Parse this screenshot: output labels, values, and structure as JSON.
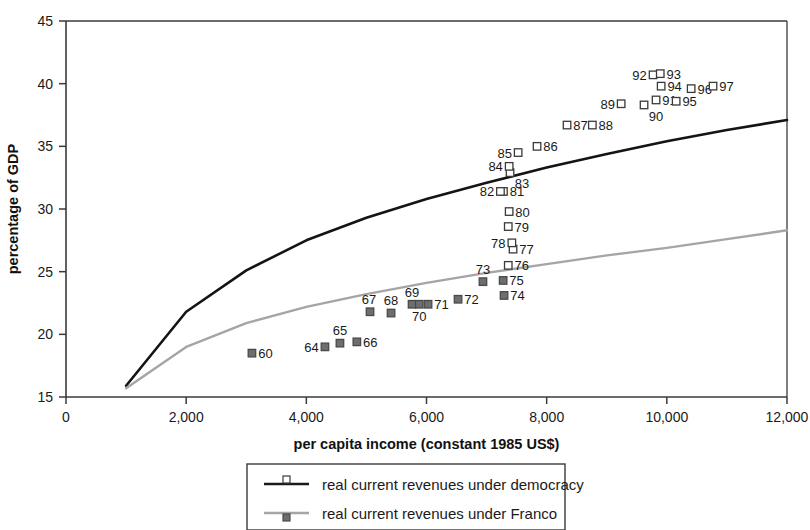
{
  "chart_data": {
    "type": "scatter",
    "title": "",
    "xlabel": "per capita income (constant 1985 US$)",
    "ylabel": "percentage of GDP",
    "xlim": [
      0,
      12000
    ],
    "ylim": [
      15,
      45
    ],
    "xticks": [
      0,
      2000,
      4000,
      6000,
      8000,
      10000,
      12000
    ],
    "xticklabels": [
      "0",
      "2,000",
      "4,000",
      "6,000",
      "8,000",
      "10,000",
      "12,000"
    ],
    "yticks": [
      15,
      20,
      25,
      30,
      35,
      40,
      45
    ],
    "yticklabels": [
      "15",
      "20",
      "25",
      "30",
      "35",
      "40",
      "45"
    ],
    "grid": false,
    "legend_position": "below-center",
    "legend": [
      {
        "label": "real current revenues under democracy",
        "marker": "open-square",
        "line_color": "#1a1a1a"
      },
      {
        "label": "real current revenues under Franco",
        "marker": "filled-square",
        "line_color": "#a5a5a5"
      }
    ],
    "series": [
      {
        "name": "real current revenues under democracy",
        "marker": "open-square",
        "marker_color": "#ffffff",
        "marker_edge": "#3a3a3a",
        "points": [
          {
            "label": "76",
            "x": 7360,
            "y": 25.5,
            "label_pos": "right"
          },
          {
            "label": "77",
            "x": 7440,
            "y": 26.8,
            "label_pos": "right"
          },
          {
            "label": "78",
            "x": 7420,
            "y": 27.3,
            "label_pos": "left"
          },
          {
            "label": "79",
            "x": 7360,
            "y": 28.6,
            "label_pos": "right"
          },
          {
            "label": "80",
            "x": 7375,
            "y": 29.8,
            "label_pos": "right"
          },
          {
            "label": "81",
            "x": 7280,
            "y": 31.4,
            "label_pos": "right"
          },
          {
            "label": "82",
            "x": 7230,
            "y": 31.4,
            "label_pos": "left"
          },
          {
            "label": "83",
            "x": 7390,
            "y": 32.9,
            "label_pos": "below-right"
          },
          {
            "label": "84",
            "x": 7375,
            "y": 33.4,
            "label_pos": "left"
          },
          {
            "label": "85",
            "x": 7525,
            "y": 34.5,
            "label_pos": "left"
          },
          {
            "label": "86",
            "x": 7840,
            "y": 35.0,
            "label_pos": "right"
          },
          {
            "label": "87",
            "x": 8340,
            "y": 36.7,
            "label_pos": "right"
          },
          {
            "label": "88",
            "x": 8760,
            "y": 36.7,
            "label_pos": "right"
          },
          {
            "label": "89",
            "x": 9240,
            "y": 38.4,
            "label_pos": "left"
          },
          {
            "label": "90",
            "x": 9620,
            "y": 38.3,
            "label_pos": "below-right"
          },
          {
            "label": "91",
            "x": 9820,
            "y": 38.7,
            "label_pos": "right"
          },
          {
            "label": "92",
            "x": 9770,
            "y": 40.7,
            "label_pos": "left"
          },
          {
            "label": "93",
            "x": 9890,
            "y": 40.8,
            "label_pos": "right"
          },
          {
            "label": "94",
            "x": 9905,
            "y": 39.8,
            "label_pos": "right"
          },
          {
            "label": "95",
            "x": 10155,
            "y": 38.6,
            "label_pos": "right"
          },
          {
            "label": "96",
            "x": 10405,
            "y": 39.6,
            "label_pos": "right"
          },
          {
            "label": "97",
            "x": 10770,
            "y": 39.8,
            "label_pos": "right"
          }
        ]
      },
      {
        "name": "real current revenues under Franco",
        "marker": "filled-square",
        "marker_color": "#6e6e6e",
        "marker_edge": "#4a4a4a",
        "points": [
          {
            "label": "60",
            "x": 3095,
            "y": 18.5,
            "label_pos": "right"
          },
          {
            "label": "64",
            "x": 4310,
            "y": 19.0,
            "label_pos": "left"
          },
          {
            "label": "65",
            "x": 4560,
            "y": 19.3,
            "label_pos": "above"
          },
          {
            "label": "66",
            "x": 4840,
            "y": 19.4,
            "label_pos": "right"
          },
          {
            "label": "67",
            "x": 5060,
            "y": 21.8,
            "label_pos": "above-left"
          },
          {
            "label": "68",
            "x": 5410,
            "y": 21.7,
            "label_pos": "above"
          },
          {
            "label": "69",
            "x": 5760,
            "y": 22.4,
            "label_pos": "above"
          },
          {
            "label": "70",
            "x": 5880,
            "y": 22.4,
            "label_pos": "below"
          },
          {
            "label": "71",
            "x": 6025,
            "y": 22.4,
            "label_pos": "right"
          },
          {
            "label": "72",
            "x": 6525,
            "y": 22.8,
            "label_pos": "right"
          },
          {
            "label": "73",
            "x": 6940,
            "y": 24.2,
            "label_pos": "above"
          },
          {
            "label": "74",
            "x": 7290,
            "y": 23.1,
            "label_pos": "right"
          },
          {
            "label": "75",
            "x": 7275,
            "y": 24.3,
            "label_pos": "right"
          }
        ]
      }
    ],
    "trend_lines": [
      {
        "name": "democracy-trend",
        "color": "#141414",
        "width": 2.6,
        "points": [
          {
            "x": 1000,
            "y": 15.9
          },
          {
            "x": 2000,
            "y": 21.8
          },
          {
            "x": 3000,
            "y": 25.1
          },
          {
            "x": 4000,
            "y": 27.5
          },
          {
            "x": 5000,
            "y": 29.3
          },
          {
            "x": 6000,
            "y": 30.8
          },
          {
            "x": 7000,
            "y": 32.1
          },
          {
            "x": 8000,
            "y": 33.3
          },
          {
            "x": 9000,
            "y": 34.4
          },
          {
            "x": 10000,
            "y": 35.4
          },
          {
            "x": 11000,
            "y": 36.3
          },
          {
            "x": 12000,
            "y": 37.1
          }
        ]
      },
      {
        "name": "franco-trend",
        "color": "#a5a5a5",
        "width": 2.4,
        "points": [
          {
            "x": 1000,
            "y": 15.7
          },
          {
            "x": 2000,
            "y": 19.0
          },
          {
            "x": 3000,
            "y": 20.9
          },
          {
            "x": 4000,
            "y": 22.2
          },
          {
            "x": 5000,
            "y": 23.2
          },
          {
            "x": 6000,
            "y": 24.1
          },
          {
            "x": 7000,
            "y": 24.9
          },
          {
            "x": 8000,
            "y": 25.6
          },
          {
            "x": 9000,
            "y": 26.3
          },
          {
            "x": 10000,
            "y": 26.9
          },
          {
            "x": 11000,
            "y": 27.6
          },
          {
            "x": 12000,
            "y": 28.3
          }
        ]
      }
    ]
  }
}
